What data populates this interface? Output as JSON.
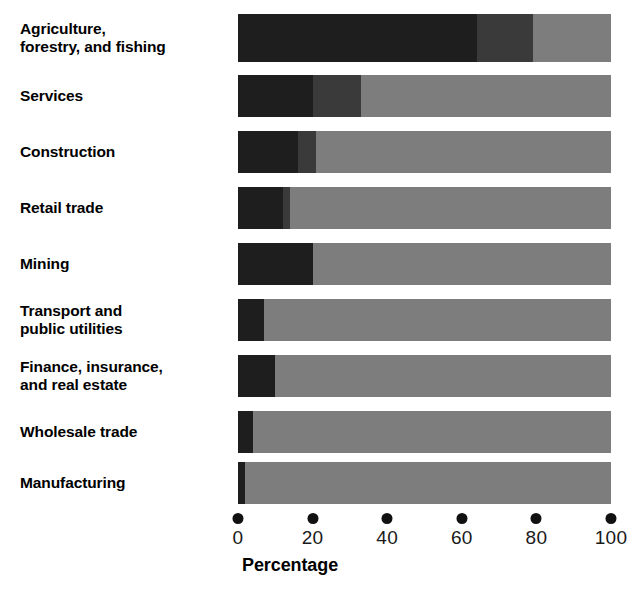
{
  "chart_data": {
    "type": "bar",
    "orientation": "horizontal",
    "stacked": true,
    "title": "",
    "xlabel": "Percentage",
    "ylabel": "",
    "xlim": [
      0,
      100
    ],
    "xticks": [
      "0",
      "20",
      "40",
      "60",
      "80",
      "100"
    ],
    "grid": false,
    "legend": "none",
    "categories": [
      "Agriculture,\nforestry, and fishing",
      "Services",
      "Construction",
      "Retail trade",
      "Mining",
      "Transport and\npublic utilities",
      "Finance, insurance,\nand real estate",
      "Wholesale trade",
      "Manufacturing"
    ],
    "series": [
      {
        "name": "darkest",
        "color": "#1e1e1e",
        "values": [
          64,
          20,
          16,
          12,
          20,
          7,
          10,
          4,
          2
        ]
      },
      {
        "name": "medium",
        "color": "#3a3a3a",
        "values": [
          15,
          13,
          5,
          2,
          0,
          0,
          0,
          0,
          0
        ]
      },
      {
        "name": "light",
        "color": "#7d7d7d",
        "values": [
          21,
          67,
          79,
          86,
          80,
          93,
          90,
          96,
          98
        ]
      }
    ]
  },
  "axis": {
    "title": "Percentage",
    "ticks": [
      {
        "label": "0",
        "value": 0
      },
      {
        "label": "20",
        "value": 20
      },
      {
        "label": "40",
        "value": 40
      },
      {
        "label": "60",
        "value": 60
      },
      {
        "label": "80",
        "value": 80
      },
      {
        "label": "100",
        "value": 100
      }
    ]
  },
  "colors": {
    "darkest": "#1e1e1e",
    "medium": "#3a3a3a",
    "light": "#7d7d7d",
    "background": "#ffffff",
    "text": "#000000"
  }
}
